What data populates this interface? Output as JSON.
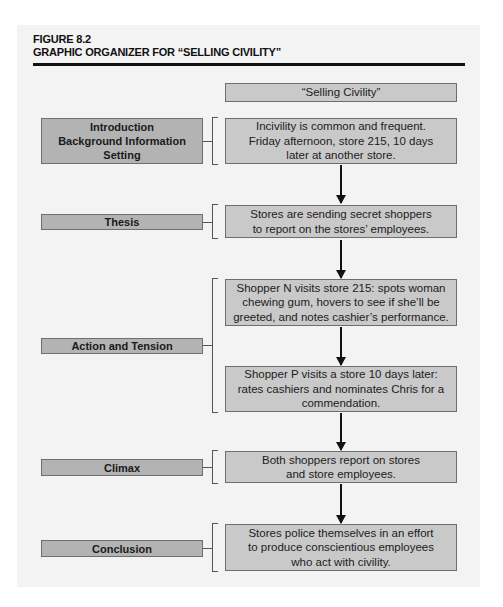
{
  "figure": {
    "number": "FIGURE 8.2",
    "title": "GRAPHIC ORGANIZER FOR “SELLING CIVILITY”"
  },
  "diagram": {
    "title_box": "“Selling Civility”",
    "sections": [
      {
        "label": "Introduction\nBackground Information\nSetting",
        "content": [
          "Incivility is common and frequent.\nFriday afternoon, store 215, 10 days\nlater at another store."
        ]
      },
      {
        "label": "Thesis",
        "content": [
          "Stores are sending secret shoppers\nto report on the stores’ employees."
        ]
      },
      {
        "label": "Action and Tension",
        "content": [
          "Shopper N visits store 215: spots woman\nchewing gum, hovers to see if she’ll be\ngreeted, and notes cashier’s performance.",
          "Shopper P visits a store 10 days later:\nrates cashiers and nominates Chris for a\ncommendation."
        ]
      },
      {
        "label": "Climax",
        "content": [
          "Both shoppers report on stores\nand store employees."
        ]
      },
      {
        "label": "Conclusion",
        "content": [
          "Stores police themselves in an effort\nto produce conscientious employees\nwho act with civility."
        ]
      }
    ]
  },
  "colors": {
    "panel_bg": "#f3f3f3",
    "label_fill": "#b3b3b3",
    "content_fill": "#c9c9c9",
    "border": "#6e6e6e",
    "rule": "#111111"
  }
}
